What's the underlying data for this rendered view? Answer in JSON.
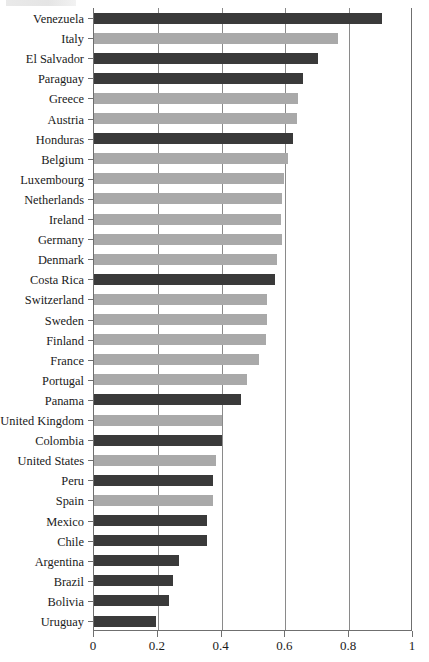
{
  "chart_data": {
    "type": "bar",
    "orientation": "horizontal",
    "title": "",
    "subtitle": "",
    "xlabel": "",
    "ylabel": "",
    "xlim": [
      0,
      1
    ],
    "ylim": null,
    "grid": true,
    "grid_axis": "x",
    "legend": null,
    "legend_position": "none",
    "xticks": [
      "0",
      "0.2",
      "0.4",
      "0.6",
      "0.8",
      "1"
    ],
    "xtick_values": [
      0,
      0.2,
      0.4,
      0.6,
      0.8,
      1
    ],
    "colors": {
      "dark": "#3a3a3a",
      "light": "#a9a9a9",
      "axis": "#6f6f6f",
      "grid": "#8a8a8a",
      "text": "#1a1a1a",
      "background": "#ffffff"
    },
    "categories": [
      "Venezuela",
      "Italy",
      "El Salvador",
      "Paraguay",
      "Greece",
      "Austria",
      "Honduras",
      "Belgium",
      "Luxembourg",
      "Netherlands",
      "Ireland",
      "Germany",
      "Denmark",
      "Costa Rica",
      "Switzerland",
      "Sweden",
      "Finland",
      "France",
      "Portugal",
      "Panama",
      "United Kingdom",
      "Colombia",
      "United States",
      "Peru",
      "Spain",
      "Mexico",
      "Chile",
      "Argentina",
      "Brazil",
      "Bolivia",
      "Uruguay"
    ],
    "values": [
      0.903,
      0.765,
      0.702,
      0.655,
      0.64,
      0.637,
      0.624,
      0.608,
      0.596,
      0.589,
      0.586,
      0.589,
      0.574,
      0.567,
      0.542,
      0.542,
      0.54,
      0.517,
      0.48,
      0.461,
      0.401,
      0.401,
      0.382,
      0.373,
      0.373,
      0.354,
      0.354,
      0.266,
      0.248,
      0.235,
      0.194
    ],
    "shades": [
      "dark",
      "light",
      "dark",
      "dark",
      "light",
      "light",
      "dark",
      "light",
      "light",
      "light",
      "light",
      "light",
      "light",
      "dark",
      "light",
      "light",
      "light",
      "light",
      "light",
      "dark",
      "light",
      "dark",
      "light",
      "dark",
      "light",
      "dark",
      "dark",
      "dark",
      "dark",
      "dark",
      "dark"
    ],
    "bars": [
      {
        "label": "Venezuela",
        "value": 0.903,
        "shade": "dark"
      },
      {
        "label": "Italy",
        "value": 0.765,
        "shade": "light"
      },
      {
        "label": "El Salvador",
        "value": 0.702,
        "shade": "dark"
      },
      {
        "label": "Paraguay",
        "value": 0.655,
        "shade": "dark"
      },
      {
        "label": "Greece",
        "value": 0.64,
        "shade": "light"
      },
      {
        "label": "Austria",
        "value": 0.637,
        "shade": "light"
      },
      {
        "label": "Honduras",
        "value": 0.624,
        "shade": "dark"
      },
      {
        "label": "Belgium",
        "value": 0.608,
        "shade": "light"
      },
      {
        "label": "Luxembourg",
        "value": 0.596,
        "shade": "light"
      },
      {
        "label": "Netherlands",
        "value": 0.589,
        "shade": "light"
      },
      {
        "label": "Ireland",
        "value": 0.586,
        "shade": "light"
      },
      {
        "label": "Germany",
        "value": 0.589,
        "shade": "light"
      },
      {
        "label": "Denmark",
        "value": 0.574,
        "shade": "light"
      },
      {
        "label": "Costa Rica",
        "value": 0.567,
        "shade": "dark"
      },
      {
        "label": "Switzerland",
        "value": 0.542,
        "shade": "light"
      },
      {
        "label": "Sweden",
        "value": 0.542,
        "shade": "light"
      },
      {
        "label": "Finland",
        "value": 0.54,
        "shade": "light"
      },
      {
        "label": "France",
        "value": 0.517,
        "shade": "light"
      },
      {
        "label": "Portugal",
        "value": 0.48,
        "shade": "light"
      },
      {
        "label": "Panama",
        "value": 0.461,
        "shade": "dark"
      },
      {
        "label": "United Kingdom",
        "value": 0.401,
        "shade": "light"
      },
      {
        "label": "Colombia",
        "value": 0.401,
        "shade": "dark"
      },
      {
        "label": "United States",
        "value": 0.382,
        "shade": "light"
      },
      {
        "label": "Peru",
        "value": 0.373,
        "shade": "dark"
      },
      {
        "label": "Spain",
        "value": 0.373,
        "shade": "light"
      },
      {
        "label": "Mexico",
        "value": 0.354,
        "shade": "dark"
      },
      {
        "label": "Chile",
        "value": 0.354,
        "shade": "dark"
      },
      {
        "label": "Argentina",
        "value": 0.266,
        "shade": "dark"
      },
      {
        "label": "Brazil",
        "value": 0.248,
        "shade": "dark"
      },
      {
        "label": "Bolivia",
        "value": 0.235,
        "shade": "dark"
      },
      {
        "label": "Uruguay",
        "value": 0.194,
        "shade": "dark"
      }
    ]
  }
}
